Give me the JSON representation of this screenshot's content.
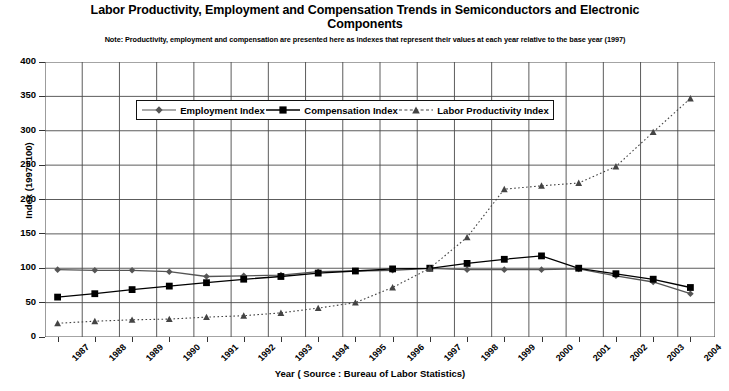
{
  "chart_data": {
    "type": "line",
    "title": "Labor Productivity, Employment and Compensation Trends in Semiconductors and Electronic Components",
    "note": "Note: Productivity, employment and compensation are presented here as indexes that represent their values at each year relative to the base year (1997)",
    "xlabel": "Year ( Source : Bureau of Labor Statistics)",
    "ylabel": "Index (1997=100)",
    "ylim": [
      0,
      400
    ],
    "ytick_step": 50,
    "yticks": [
      "400",
      "350",
      "300",
      "250",
      "200",
      "150",
      "100",
      "50",
      "0"
    ],
    "grid": true,
    "legend_position": "upper-left-inside",
    "categories": [
      "1987",
      "1988",
      "1989",
      "1990",
      "1991",
      "1992",
      "1993",
      "1994",
      "1995",
      "1996",
      "1997",
      "1998",
      "1999",
      "2000",
      "2001",
      "2002",
      "2003",
      "2004"
    ],
    "series": [
      {
        "name": "Employment Index",
        "marker": "diamond",
        "linestyle": "solid",
        "color": "#555555",
        "values": [
          98,
          97,
          97,
          95,
          88,
          89,
          90,
          95,
          96,
          97,
          100,
          98,
          98,
          98,
          99,
          89,
          80,
          63
        ]
      },
      {
        "name": "Compensation Index",
        "marker": "square",
        "linestyle": "solid",
        "color": "#000000",
        "values": [
          58,
          63,
          69,
          74,
          79,
          84,
          88,
          93,
          96,
          99,
          100,
          107,
          113,
          118,
          100,
          92,
          84,
          72
        ]
      },
      {
        "name": "Labor Productivity Index",
        "marker": "triangle",
        "linestyle": "dotted",
        "color": "#444444",
        "values": [
          20,
          23,
          25,
          26,
          29,
          31,
          35,
          42,
          50,
          72,
          100,
          145,
          215,
          220,
          224,
          248,
          298,
          347
        ]
      }
    ]
  },
  "legend": {
    "items": [
      {
        "label": "Employment Index"
      },
      {
        "label": "Compensation Index"
      },
      {
        "label": "Labor Productivity Index"
      }
    ]
  }
}
